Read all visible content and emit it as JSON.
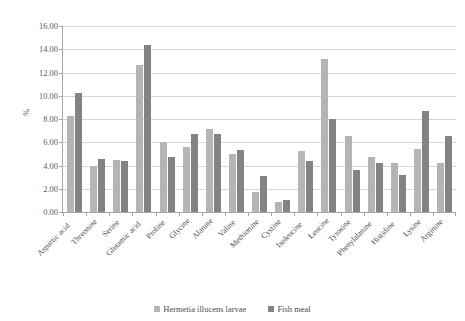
{
  "chart_data": {
    "type": "bar",
    "title": "",
    "xlabel": "",
    "ylabel": "%",
    "ylim": [
      0,
      16
    ],
    "ytick_step": 2,
    "ytick_labels": [
      "0.00",
      "2.00",
      "4.00",
      "6.00",
      "8.00",
      "10.00",
      "12.00",
      "14.00",
      "16.00"
    ],
    "grid": true,
    "legend_position": "bottom",
    "categories": [
      "Aspartic acid",
      "Threonine",
      "Serine",
      "Glutamic acid",
      "Proline",
      "Glycine",
      "Alanine",
      "Valine",
      "Methionine",
      "Cystine",
      "Isoleucine",
      "Leucine",
      "Tyrosine",
      "Phenylalanine",
      "Histidine",
      "Lysine",
      "Arginine"
    ],
    "series": [
      {
        "name": "Hermetia illucens larvae",
        "color": "#b5b5b5",
        "values": [
          8.25,
          4.0,
          4.5,
          12.65,
          6.05,
          5.55,
          7.15,
          5.0,
          1.75,
          0.85,
          5.25,
          13.2,
          6.55,
          4.7,
          4.25,
          5.45,
          4.25
        ]
      },
      {
        "name": "Fish meal",
        "color": "#838383",
        "values": [
          10.2,
          4.55,
          4.4,
          14.35,
          4.75,
          6.7,
          6.7,
          5.3,
          3.1,
          1.0,
          4.4,
          8.0,
          3.65,
          4.25,
          3.2,
          8.7,
          6.5
        ]
      }
    ]
  },
  "legend": {
    "items": [
      {
        "label": "Hermetia illucens larvae"
      },
      {
        "label": "Fish meal"
      }
    ]
  }
}
